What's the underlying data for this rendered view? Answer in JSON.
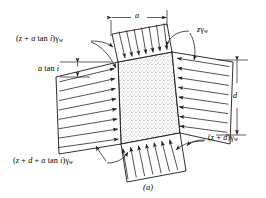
{
  "figure": {
    "caption": "(a)",
    "labels": {
      "top_left_pressure": "(z + a tan i)γw",
      "top_right_pressure": "zγw",
      "bottom_left_pressure": "(z + d + a tan i)γw",
      "bottom_right_pressure": "(z + d)γw",
      "width_dimension": "a",
      "height_dimension": "d",
      "offset_dimension": "a tan i"
    },
    "label_parts": {
      "tl_open": "(",
      "tl_z": "z",
      "tl_plus": " + ",
      "tl_a": "a",
      "tl_tan": " tan ",
      "tl_i": "i",
      "tl_close": ")",
      "tl_gamma": "γ",
      "tl_w": "w",
      "tr_z": "z",
      "tr_gamma": "γ",
      "tr_w": "w",
      "bl_open": "(",
      "bl_z": "z",
      "bl_plus1": " + ",
      "bl_d": "d",
      "bl_plus2": " + ",
      "bl_a": "a",
      "bl_tan": " tan ",
      "bl_i": "i",
      "bl_close": ")",
      "bl_gamma": "γ",
      "bl_w": "w",
      "br_open": "(",
      "br_z": "z",
      "br_plus": " + ",
      "br_d": "d",
      "br_close": ")",
      "br_gamma": "γ",
      "br_w": "w",
      "dim_a": "a",
      "dim_d": "d",
      "dim_atan_a": "a",
      "dim_atan_tan": " tan ",
      "dim_atan_i": "i"
    },
    "colors": {
      "line": "#1a1a1a",
      "fill": "#ffffff",
      "stipple": "#6b6b6b",
      "background": "#ffffff"
    },
    "geometry": {
      "element_corners": [
        [
          118,
          62
        ],
        [
          172,
          52
        ],
        [
          180,
          133
        ],
        [
          121,
          144
        ]
      ],
      "description": "tilted square soil element with pore water pressure distributions on four faces"
    }
  }
}
